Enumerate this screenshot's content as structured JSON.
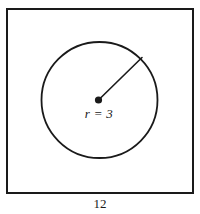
{
  "figure": {
    "type": "geometry-diagram",
    "colors": {
      "stroke": "#1a1a1a",
      "fill": "#ffffff",
      "background": "#ffffff"
    },
    "square": {
      "name": "outer-square",
      "side_label": "12",
      "x": 7,
      "y": 9,
      "width": 186,
      "height": 184,
      "stroke_width": 1.8
    },
    "circle": {
      "name": "inscribed-circle",
      "cx": 99.5,
      "cy": 100,
      "r": 58,
      "stroke_width": 1.8
    },
    "center_dot": {
      "name": "circle-center-point",
      "cx": 98.5,
      "cy": 100,
      "r": 3.6
    },
    "radius_line": {
      "name": "radius-segment",
      "x1": 98.5,
      "y1": 100,
      "x2": 142,
      "y2": 57.5,
      "stroke_width": 1.6
    },
    "labels": {
      "radius": "r = 3",
      "bottom_dimension": "12"
    }
  }
}
